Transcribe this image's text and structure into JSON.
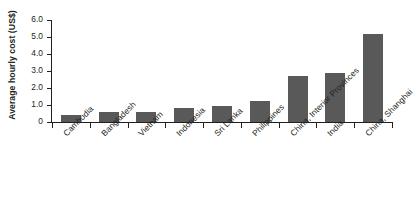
{
  "chart_data": {
    "type": "bar",
    "title": "",
    "subtitle": "",
    "xlabel": "",
    "ylabel": "Average hourly cost (US$)",
    "categories": [
      "Cambodia",
      "Bangladesh",
      "Vietnam",
      "Indonesia",
      "Sri Lanka",
      "Philippines",
      "China, Interior Provinces",
      "India",
      "China, Shanghai"
    ],
    "values": [
      0.42,
      0.6,
      0.6,
      0.8,
      0.95,
      1.25,
      2.7,
      2.88,
      5.15
    ],
    "ylim": [
      0,
      6.0
    ],
    "yticks": [
      0,
      1.0,
      2.0,
      3.0,
      4.0,
      5.0,
      6.0
    ],
    "ytick_labels": [
      "0",
      "1.0",
      "2.0",
      "3.0",
      "4.0",
      "5.0",
      "6.0"
    ],
    "grid": false,
    "legend": null,
    "legend_position": "none",
    "bar_color": "#595959",
    "axis_color": "#231f20",
    "background": "#ffffff"
  }
}
